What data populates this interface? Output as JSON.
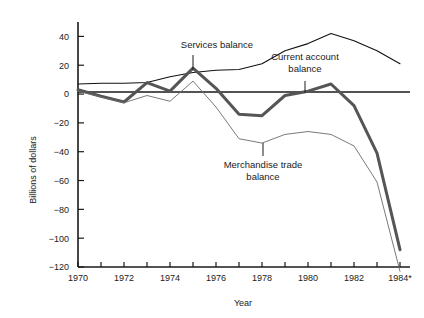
{
  "chart_data": {
    "type": "line",
    "title": "",
    "xlabel": "Year",
    "ylabel": "Billions of dollars",
    "xlim": [
      1970,
      1984
    ],
    "ylim": [
      -120,
      50
    ],
    "yticks": [
      40,
      20,
      0,
      -20,
      -40,
      -60,
      -80,
      -100,
      -120
    ],
    "ytick_labels": [
      "40",
      "20",
      "0",
      "−20",
      "−40",
      "−60",
      "−80",
      "−100",
      "−120"
    ],
    "xticks": [
      1970,
      1971,
      1972,
      1973,
      1974,
      1975,
      1976,
      1977,
      1978,
      1979,
      1980,
      1981,
      1982,
      1983,
      1984
    ],
    "xtick_labels": [
      "1970",
      "",
      "1972",
      "",
      "1974",
      "",
      "1976",
      "",
      "1978",
      "",
      "1980",
      "",
      "1982",
      "",
      "1984*"
    ],
    "grid": false,
    "legend_position": "inline-annotations",
    "zero_line": true,
    "x": [
      1970,
      1971,
      1972,
      1973,
      1974,
      1975,
      1976,
      1977,
      1978,
      1979,
      1980,
      1981,
      1982,
      1983,
      1984
    ],
    "series": [
      {
        "name": "Services balance",
        "label": "Services balance",
        "color": "#111111",
        "width": 1.1,
        "values": [
          7,
          7.5,
          7.5,
          8,
          12,
          15,
          16.5,
          17,
          21,
          30,
          35,
          42,
          37,
          30,
          21
        ]
      },
      {
        "name": "Current account balance",
        "label": "Current account balance",
        "color": "#555555",
        "width": 3.0,
        "values": [
          3,
          -1.5,
          -5.5,
          8,
          2,
          18,
          4,
          -14,
          -15,
          -1,
          2,
          7,
          -8,
          -41,
          -108
        ]
      },
      {
        "name": "Merchandise trade balance",
        "label": "Merchandise trade balance",
        "color": "#6b6b6b",
        "width": 0.9,
        "values": [
          2,
          -2,
          -6,
          -1,
          -5,
          9,
          -9,
          -31,
          -34,
          -28,
          -26,
          -28,
          -36,
          -61,
          -123
        ]
      }
    ],
    "annotations": [
      {
        "text_lines": [
          "Services balance"
        ],
        "series": "Services balance",
        "text_x": 217,
        "text_y": 48,
        "anchor": "middle",
        "leader": {
          "x1": 193,
          "y1": 55,
          "x2": 193,
          "y2": 70
        }
      },
      {
        "text_lines": [
          "Current account",
          "balance"
        ],
        "series": "Current account balance",
        "text_x": 305,
        "text_y": 60,
        "anchor": "middle",
        "leader": {
          "x1": 305,
          "y1": 81,
          "x2": 305,
          "y2": 93
        }
      },
      {
        "text_lines": [
          "Merchandise trade",
          "balance"
        ],
        "series": "Merchandise trade balance",
        "text_x": 263,
        "text_y": 168,
        "anchor": "middle",
        "leader": {
          "x1": 263,
          "y1": 143,
          "x2": 263,
          "y2": 156
        }
      }
    ]
  },
  "axes": {
    "y_axis_title": "Billions of dollars",
    "x_axis_title": "Year"
  }
}
